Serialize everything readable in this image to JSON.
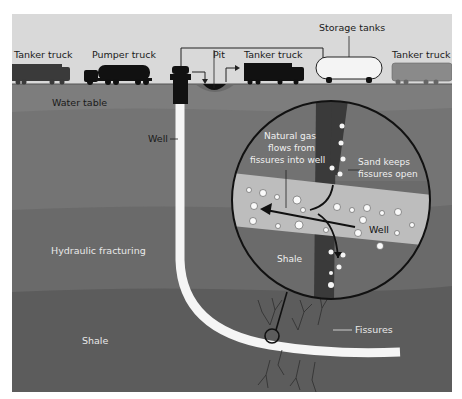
{
  "diagram": {
    "type": "cross-section"
  },
  "surface_labels": {
    "tanker_truck_left": "Tanker truck",
    "pumper_truck": "Pumper truck",
    "pit": "Pit",
    "tanker_truck_middle": "Tanker truck",
    "storage_tanks": "Storage tanks",
    "tanker_truck_right": "Tanker truck"
  },
  "subsurface_labels": {
    "water_table": "Water table",
    "well": "Well",
    "hydraulic_fracturing": "Hydraulic fracturing",
    "shale": "Shale",
    "fissures": "Fissures"
  },
  "inset_labels": {
    "gas_flow_line1": "Natural gas",
    "gas_flow_line2": "flows from",
    "gas_flow_line3": "fissures into well",
    "sand_line1": "Sand keeps",
    "sand_line2": "fissures open",
    "well": "Well",
    "shale": "Shale"
  },
  "colors": {
    "sky": "#dcdcdc",
    "ground_top": "#7a7a7a",
    "ground_mid": "#6e6e6e",
    "ground_frac": "#666666",
    "shale_layer": "#5a5a5a",
    "inset_bg": "#6a6a6a",
    "inset_well_band": "#bdbdbd",
    "fissure_dark": "#3a3a3a",
    "vehicle": "#111111",
    "vehicle_grey": "#8a8a8a"
  }
}
